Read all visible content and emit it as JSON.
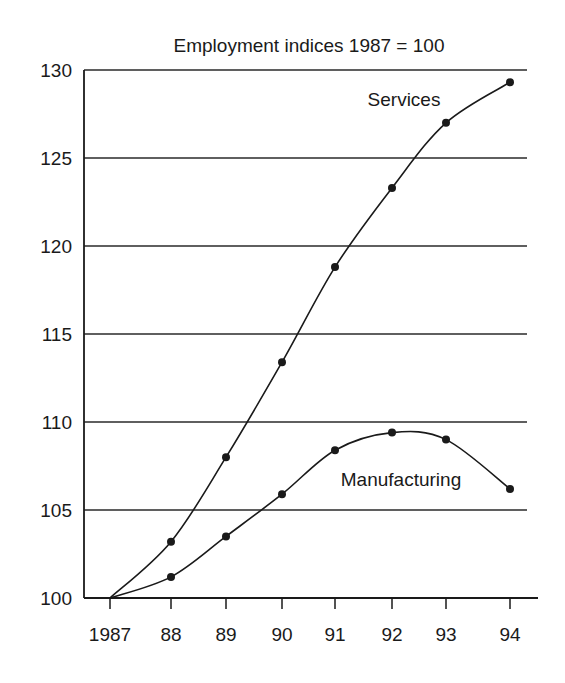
{
  "chart_data": {
    "type": "line",
    "title": "Employment indices 1987 = 100",
    "xlabel": "",
    "ylabel": "",
    "categories": [
      "1987",
      "88",
      "89",
      "90",
      "91",
      "92",
      "93",
      "94"
    ],
    "x": [
      1987,
      1988,
      1989,
      1990,
      1991,
      1992,
      1993,
      1994
    ],
    "ylim": [
      100,
      130
    ],
    "yticks": [
      100,
      105,
      110,
      115,
      120,
      125,
      130
    ],
    "grid": "horizontal",
    "legend": "inline labels",
    "series": [
      {
        "name": "Services",
        "values": [
          100,
          103.2,
          108.0,
          113.4,
          118.8,
          123.3,
          127.0,
          129.3
        ],
        "markers": "dots from 1988",
        "color": "#1a1a1a"
      },
      {
        "name": "Manufacturing",
        "values": [
          100,
          101.2,
          103.5,
          105.9,
          108.4,
          109.4,
          109.0,
          106.2
        ],
        "markers": "dots from 1988",
        "color": "#1a1a1a"
      }
    ]
  }
}
